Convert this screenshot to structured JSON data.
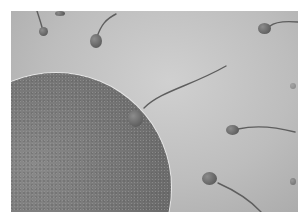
{
  "image": {
    "description": "Grayscale illustration of sperm cells swimming toward a large textured egg cell, one sperm touching the egg surface",
    "subjects": [
      "egg-cell",
      "sperm-cell"
    ],
    "sperm_count_visible": 9,
    "colors": {
      "background": "#bdbdbd",
      "egg": "#727272",
      "sperm_head": "#5a5a5a",
      "border": "#ffffff"
    }
  }
}
